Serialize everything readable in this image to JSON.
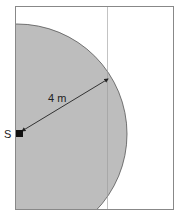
{
  "diagram": {
    "source_label": "S",
    "radius_label": "4 m",
    "colors": {
      "region_fill": "#bdbdbd",
      "frame_stroke": "#888888",
      "arrow": "#222222",
      "background": "#ffffff"
    }
  }
}
